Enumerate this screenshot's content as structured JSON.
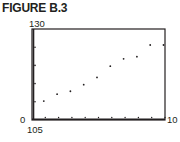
{
  "figure": {
    "title": "FIGURE B.3"
  },
  "window": {
    "ymax_label": "130",
    "xmin_label": "0",
    "xmax_label": "10",
    "ymin_label": "105"
  },
  "chart_data": {
    "type": "scatter",
    "title": "FIGURE B.3",
    "xlabel": "",
    "ylabel": "",
    "xlim": [
      0,
      10
    ],
    "ylim": [
      105,
      130
    ],
    "x_ticks_step": 1,
    "y_ticks_step": 5,
    "grid": false,
    "legend": null,
    "series": [
      {
        "name": "data",
        "x": [
          1,
          2,
          3,
          4,
          5,
          6,
          7,
          8,
          9,
          10
        ],
        "y": [
          110.2,
          112.1,
          112.9,
          114.7,
          116.7,
          119.8,
          121.8,
          122.4,
          125.6,
          125.6
        ]
      }
    ],
    "colors": {
      "axis": "#231f20",
      "point": "#231f20"
    }
  }
}
